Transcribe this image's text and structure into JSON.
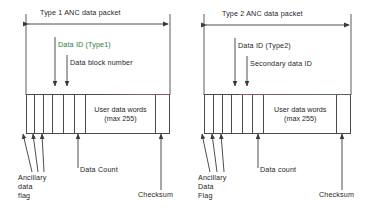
{
  "figure": {
    "background": "#ffffff",
    "line_color": "#4a4a4a",
    "text_color": "#1f1f1f",
    "accent_green": "#2f7a3f"
  },
  "panels": [
    {
      "id": "type1",
      "span_title": "Type 1 ANC data packet",
      "top_callouts": [
        {
          "name": "data-id",
          "text": "Data ID (Type1)",
          "color": "green"
        },
        {
          "name": "data-block-number",
          "text": "Data block number",
          "color": "default"
        }
      ],
      "packet": {
        "user_data_label_line1": "User data words",
        "user_data_label_line2": "(max 255)"
      },
      "bottom_callouts": [
        {
          "name": "ancillary-data-flag",
          "text": "Ancillary\ndata\nflag"
        },
        {
          "name": "data-count",
          "text": "Data Count"
        },
        {
          "name": "checksum",
          "text": "Checksum"
        }
      ]
    },
    {
      "id": "type2",
      "span_title": "Type 2 ANC data packet",
      "top_callouts": [
        {
          "name": "data-id",
          "text": "Data ID (Type2)",
          "color": "default"
        },
        {
          "name": "secondary-data-id",
          "text": "Secondary data ID",
          "color": "default"
        }
      ],
      "packet": {
        "user_data_label_line1": "User data words",
        "user_data_label_line2": "(max 255)"
      },
      "bottom_callouts": [
        {
          "name": "ancillary-data-flag",
          "text": "Ancillary\nData\nFlag"
        },
        {
          "name": "data-count",
          "text": "Data count"
        },
        {
          "name": "checksum",
          "text": "Checksum"
        }
      ]
    }
  ]
}
